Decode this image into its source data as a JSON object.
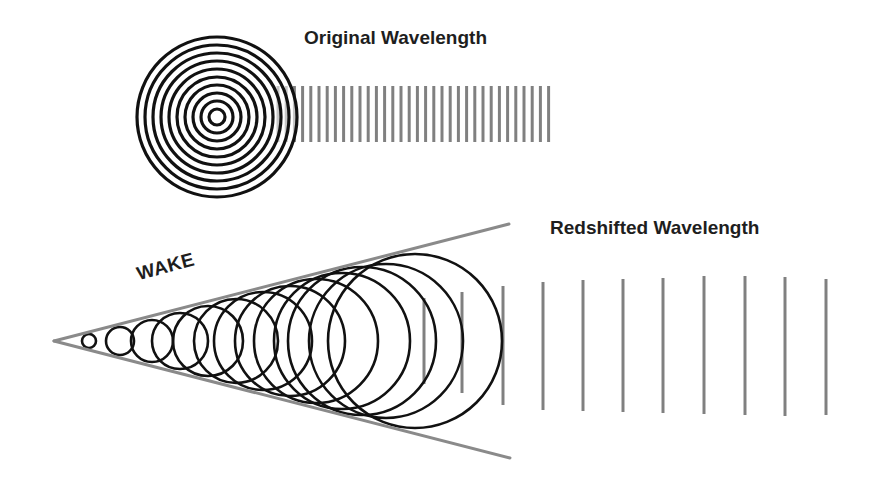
{
  "labels": {
    "original": "Original Wavelength",
    "redshifted": "Redshifted Wavelength",
    "wake": "WAKE"
  },
  "colors": {
    "background": "#ffffff",
    "circle_stroke": "#111111",
    "wave_line": "#808080",
    "cone_line": "#8a8a8a",
    "text": "#1e1e1e"
  },
  "original": {
    "center": [
      217,
      117
    ],
    "ring_radii": [
      8,
      16,
      24,
      32,
      40,
      48,
      56,
      64,
      72,
      80
    ],
    "wave_lines": {
      "x_start": 278,
      "x_end": 550,
      "spacing": 8.2,
      "y_top": 86,
      "y_bottom": 142
    }
  },
  "wake": {
    "apex": [
      54,
      341
    ],
    "upper_end": [
      509,
      224
    ],
    "lower_end": [
      510,
      458
    ],
    "circles": [
      {
        "cx": 89,
        "r": 7
      },
      {
        "cx": 120,
        "r": 14
      },
      {
        "cx": 152,
        "r": 21
      },
      {
        "cx": 180,
        "r": 28
      },
      {
        "cx": 208,
        "r": 35
      },
      {
        "cx": 236,
        "r": 42
      },
      {
        "cx": 263,
        "r": 49
      },
      {
        "cx": 290,
        "r": 55
      },
      {
        "cx": 316,
        "r": 62
      },
      {
        "cx": 342,
        "r": 68
      },
      {
        "cx": 362,
        "r": 74
      },
      {
        "cx": 386,
        "r": 77
      },
      {
        "cx": 415,
        "r": 87
      }
    ],
    "center_y": 341
  },
  "redshifted": {
    "lines": [
      {
        "x": 424,
        "y1": 298,
        "y2": 384
      },
      {
        "x": 462,
        "y1": 292,
        "y2": 393
      },
      {
        "x": 503,
        "y1": 286,
        "y2": 405
      },
      {
        "x": 543,
        "y1": 282,
        "y2": 410
      },
      {
        "x": 583,
        "y1": 280,
        "y2": 411
      },
      {
        "x": 623,
        "y1": 279,
        "y2": 412
      },
      {
        "x": 663,
        "y1": 278,
        "y2": 413
      },
      {
        "x": 704,
        "y1": 276,
        "y2": 414
      },
      {
        "x": 745,
        "y1": 276,
        "y2": 415
      },
      {
        "x": 785,
        "y1": 277,
        "y2": 416
      },
      {
        "x": 826,
        "y1": 279,
        "y2": 415
      }
    ]
  }
}
